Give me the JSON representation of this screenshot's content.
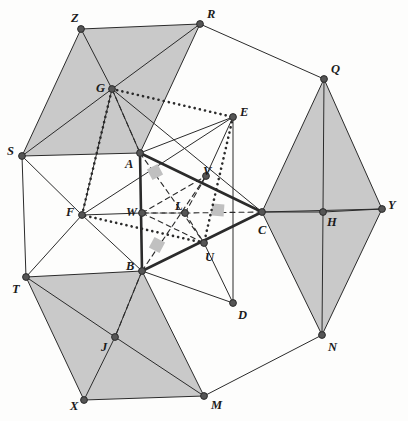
{
  "figure": {
    "background_color": "#fdfdfc",
    "shade_color": "#c9c9c9",
    "line_color": "#2b2b2b",
    "vertex_color": "#555555",
    "right_angle_marker_color": "#c0c0c0"
  },
  "points": {
    "Z": {
      "label": "Z",
      "x": 81,
      "y": 29,
      "lx": 71,
      "ly": 12
    },
    "R": {
      "label": "R",
      "x": 200,
      "y": 24,
      "lx": 207,
      "ly": 8
    },
    "Q": {
      "label": "Q",
      "x": 324,
      "y": 79,
      "lx": 331,
      "ly": 63
    },
    "Y": {
      "label": "Y",
      "x": 382,
      "y": 209,
      "lx": 388,
      "ly": 199
    },
    "N": {
      "label": "N",
      "x": 322,
      "y": 335,
      "lx": 328,
      "ly": 341
    },
    "M": {
      "label": "M",
      "x": 204,
      "y": 396,
      "lx": 211,
      "ly": 399
    },
    "X": {
      "label": "X",
      "x": 84,
      "y": 400,
      "lx": 70,
      "ly": 400
    },
    "T": {
      "label": "T",
      "x": 26,
      "y": 277,
      "lx": 12,
      "ly": 283
    },
    "S": {
      "label": "S",
      "x": 22,
      "y": 156,
      "lx": 7,
      "ly": 145
    },
    "G": {
      "label": "G",
      "x": 112,
      "y": 89,
      "lx": 96,
      "ly": 82
    },
    "A": {
      "label": "A",
      "x": 140,
      "y": 153,
      "lx": 125,
      "ly": 158
    },
    "B": {
      "label": "B",
      "x": 142,
      "y": 271,
      "lx": 126,
      "ly": 260
    },
    "C": {
      "label": "C",
      "x": 262,
      "y": 212,
      "lx": 258,
      "ly": 224
    },
    "E": {
      "label": "E",
      "x": 233,
      "y": 117,
      "lx": 240,
      "ly": 106
    },
    "D": {
      "label": "D",
      "x": 233,
      "y": 303,
      "lx": 238,
      "ly": 309
    },
    "F": {
      "label": "F",
      "x": 82,
      "y": 215,
      "lx": 66,
      "ly": 206
    },
    "H": {
      "label": "H",
      "x": 323,
      "y": 212,
      "lx": 327,
      "ly": 216
    },
    "J": {
      "label": "J",
      "x": 115,
      "y": 337,
      "lx": 101,
      "ly": 341
    },
    "W": {
      "label": "W",
      "x": 142,
      "y": 213,
      "lx": 126,
      "ly": 206
    },
    "L": {
      "label": "L",
      "x": 185,
      "y": 213,
      "lx": 175,
      "ly": 200
    },
    "U": {
      "label": "U",
      "x": 204,
      "y": 243,
      "lx": 205,
      "ly": 251
    },
    "V": {
      "label": "V",
      "x": 206,
      "y": 176,
      "lx": 203,
      "ly": 165
    }
  },
  "shaded_regions": [
    {
      "name": "region-ZRAG-left",
      "polygon": "81,29 200,24 140,153 22,156"
    },
    {
      "name": "region-QHY-right",
      "polygon": "324,79 382,209 323,212"
    },
    {
      "name": "region-QCH",
      "polygon": "324,79 323,212 262,212"
    },
    {
      "name": "region-HYN",
      "polygon": "323,212 382,209 322,335"
    },
    {
      "name": "region-CHN",
      "polygon": "262,212 323,212 322,335"
    },
    {
      "name": "region-TBJX",
      "polygon": "26,277 142,271 115,337 84,400"
    },
    {
      "name": "region-BJXM",
      "polygon": "142,271 115,337 84,400 204,396"
    }
  ],
  "thin_segments": [
    "81,29 200,24",
    "200,24 324,79",
    "324,79 382,209",
    "382,209 322,335",
    "322,335 204,396",
    "204,396 84,400",
    "84,400 26,277",
    "26,277 22,156",
    "22,156 81,29",
    "81,29 112,89",
    "200,24 112,89",
    "22,156 112,89",
    "140,153 112,89",
    "200,24 140,153",
    "22,156 140,153",
    "324,79 323,212",
    "382,209 323,212",
    "322,335 323,212",
    "262,212 323,212",
    "324,79 262,212",
    "322,335 262,212",
    "26,277 115,337",
    "84,400 115,337",
    "204,396 115,337",
    "142,271 115,337",
    "26,277 142,271",
    "204,396 142,271",
    "233,117 206,176",
    "233,117 233,303",
    "233,303 204,243",
    "233,117 140,153",
    "82,215 142,213",
    "82,215 142,271",
    "82,215 112,89",
    "22,156 82,215",
    "26,277 82,215",
    "112,89 262,212",
    "82,215 233,117",
    "142,271 233,303",
    "262,212 382,209",
    "140,153 140,153"
  ],
  "thick_segments": [
    "140,153 262,212",
    "262,212 142,271",
    "142,271 140,153"
  ],
  "dotted_segments": [
    "112,89 233,117",
    "233,117 204,243",
    "204,243 82,215",
    "82,215 112,89"
  ],
  "dashed_segments": [
    "142,213 185,213",
    "185,213 262,212",
    "140,153 204,243",
    "142,271 206,176",
    "142,213 206,176",
    "142,213 204,243",
    "185,213 206,176",
    "185,213 204,243",
    "185,213 142,213",
    "112,89 140,153",
    "142,271 115,337"
  ],
  "right_angle_markers": [
    {
      "name": "right-angle-at-A-side",
      "x": 155,
      "y": 172,
      "rot": -28
    },
    {
      "name": "right-angle-at-B-side",
      "x": 157,
      "y": 245,
      "rot": 28
    },
    {
      "name": "right-angle-at-C-side",
      "x": 218,
      "y": 210,
      "rot": 4
    }
  ],
  "line_widths": {
    "thin": 1.0,
    "thick": 2.6,
    "dotted": 2.6,
    "dashed": 1.1
  },
  "vertex_radius": 3.4
}
